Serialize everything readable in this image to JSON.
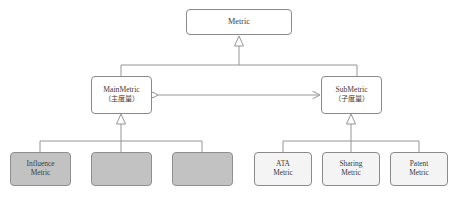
{
  "diagram": {
    "type": "uml-class-diagram",
    "canvas": {
      "width": 455,
      "height": 199
    },
    "colors": {
      "background": "#ffffff",
      "stroke": "#8a8a8a",
      "text": "#3a3a3a",
      "fill_white": "#ffffff",
      "fill_gray": "#c2c2c2",
      "fill_light": "#f4f4f4"
    }
  },
  "nodes": {
    "metric": {
      "id": "metric",
      "label": "Metric",
      "sublabel": "",
      "fill": "fill-white",
      "x": 186,
      "y": 9,
      "w": 106,
      "h": 26
    },
    "main_metric": {
      "id": "main-metric",
      "label": "MainMetric",
      "sublabel": "（主度量）",
      "fill": "fill-white",
      "x": 91,
      "y": 76,
      "w": 61,
      "h": 38
    },
    "sub_metric": {
      "id": "sub-metric",
      "label": "SubMetric",
      "sublabel": "（子度量）",
      "fill": "fill-white",
      "x": 321,
      "y": 76,
      "w": 61,
      "h": 38
    },
    "influence_metric": {
      "id": "influence-metric",
      "label": "Influence",
      "sublabel": "Metric",
      "fill": "fill-gray",
      "x": 10,
      "y": 152,
      "w": 61,
      "h": 34
    },
    "blank_metric_1": {
      "id": "blank-metric-1",
      "label": "",
      "sublabel": "",
      "fill": "fill-gray",
      "x": 91,
      "y": 152,
      "w": 61,
      "h": 34
    },
    "blank_metric_2": {
      "id": "blank-metric-2",
      "label": "",
      "sublabel": "",
      "fill": "fill-gray",
      "x": 172,
      "y": 152,
      "w": 61,
      "h": 34
    },
    "ata_metric": {
      "id": "ata-metric",
      "label": "ATA",
      "sublabel": "Metric",
      "fill": "fill-light",
      "x": 254,
      "y": 152,
      "w": 58,
      "h": 34
    },
    "sharing_metric": {
      "id": "sharing-metric",
      "label": "Sharing",
      "sublabel": "Metric",
      "fill": "fill-light",
      "x": 322,
      "y": 152,
      "w": 58,
      "h": 34
    },
    "patent_metric": {
      "id": "patent-metric",
      "label": "Patent",
      "sublabel": "Metric",
      "fill": "fill-light",
      "x": 390,
      "y": 152,
      "w": 58,
      "h": 34
    }
  },
  "edges": [
    {
      "id": "gen-metric",
      "kind": "generalization",
      "from": [
        "main-metric",
        "sub-metric"
      ],
      "to": "metric"
    },
    {
      "id": "assoc-main-sub",
      "kind": "aggregation-association",
      "from": "main-metric",
      "to": "sub-metric"
    },
    {
      "id": "gen-main",
      "kind": "generalization",
      "from": [
        "influence-metric",
        "blank-metric-1",
        "blank-metric-2"
      ],
      "to": "main-metric"
    },
    {
      "id": "gen-sub",
      "kind": "generalization",
      "from": [
        "ata-metric",
        "sharing-metric",
        "patent-metric"
      ],
      "to": "sub-metric"
    }
  ]
}
